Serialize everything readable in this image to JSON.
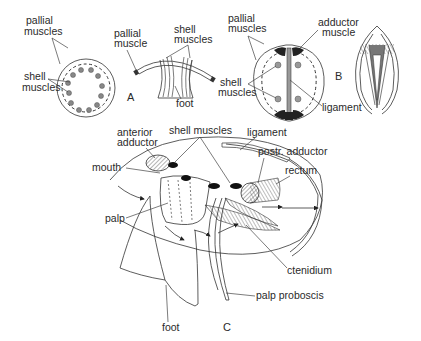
{
  "figures": {
    "A": {
      "label": "A",
      "labels": {
        "pallial_muscles": [
          "pallial",
          "muscles"
        ],
        "shell_muscles": [
          "shell",
          "muscles"
        ],
        "pallial_muscle": [
          "pallial",
          "muscle"
        ],
        "shell_muscles_side": [
          "shell",
          "muscles"
        ],
        "foot": "foot"
      }
    },
    "B": {
      "label": "B",
      "labels": {
        "pallial_muscles": [
          "pallial",
          "muscles"
        ],
        "adductor_muscle": [
          "adductor",
          "muscle"
        ],
        "shell_muscles": [
          "shell",
          "muscles"
        ],
        "ligament": "ligament"
      }
    },
    "C": {
      "label": "C",
      "labels": {
        "anterior_adductor": [
          "anterior",
          "adductor"
        ],
        "shell_muscles": "shell muscles",
        "ligament": "ligament",
        "postr_adductor": "postr. adductor",
        "rectum": "rectum",
        "mouth": "mouth",
        "palp": "palp",
        "ctenidium": "ctenidium",
        "palp_proboscis": "palp proboscis",
        "foot": "foot"
      }
    }
  },
  "colors": {
    "ink": "#2a2a2a",
    "background": "#ffffff",
    "muscle_fill": "#888888"
  }
}
